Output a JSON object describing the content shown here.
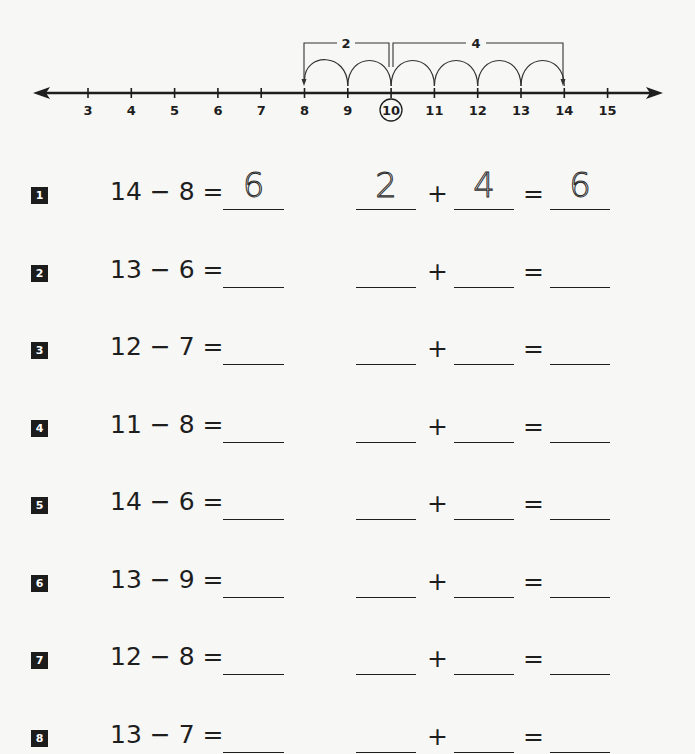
{
  "number_line": {
    "ticks": [
      "3",
      "4",
      "5",
      "6",
      "7",
      "8",
      "9",
      "10",
      "11",
      "12",
      "13",
      "14",
      "15"
    ],
    "circled_value": "10",
    "start_value": "14",
    "end_value": "8",
    "brackets": [
      {
        "label": "2",
        "from": "8",
        "to": "10"
      },
      {
        "label": "4",
        "from": "10",
        "to": "14"
      }
    ]
  },
  "problems": [
    {
      "number": "1",
      "expression": "14 − 8 =",
      "answer": "6",
      "part1": "2",
      "part2": "4",
      "sum": "6"
    },
    {
      "number": "2",
      "expression": "13 − 6 =",
      "answer": "",
      "part1": "",
      "part2": "",
      "sum": ""
    },
    {
      "number": "3",
      "expression": "12 − 7 =",
      "answer": "",
      "part1": "",
      "part2": "",
      "sum": ""
    },
    {
      "number": "4",
      "expression": "11 − 8 =",
      "answer": "",
      "part1": "",
      "part2": "",
      "sum": ""
    },
    {
      "number": "5",
      "expression": "14 − 6 =",
      "answer": "",
      "part1": "",
      "part2": "",
      "sum": ""
    },
    {
      "number": "6",
      "expression": "13 − 9 =",
      "answer": "",
      "part1": "",
      "part2": "",
      "sum": ""
    },
    {
      "number": "7",
      "expression": "12 − 8 =",
      "answer": "",
      "part1": "",
      "part2": "",
      "sum": ""
    },
    {
      "number": "8",
      "expression": "13 − 7 =",
      "answer": "",
      "part1": "",
      "part2": "",
      "sum": ""
    }
  ],
  "symbols": {
    "plus": "+",
    "equals": "="
  },
  "colors": {
    "ink": "#1e1e1e",
    "badge_bg": "#1c1c1c",
    "badge_text": "#ffffff",
    "paper": "#f7f7f5"
  }
}
